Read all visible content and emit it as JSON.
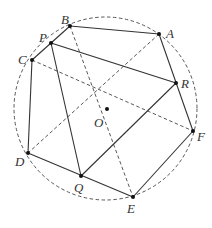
{
  "diagram": {
    "circle": {
      "cx": 105.5,
      "cy": 108.5,
      "r": 91.5,
      "style": "dashed"
    },
    "points": [
      {
        "id": "A",
        "label": "A",
        "x": 159,
        "y": 34,
        "lx": 166,
        "ly": 38
      },
      {
        "id": "B",
        "label": "B",
        "x": 70,
        "y": 26,
        "lx": 61,
        "ly": 24
      },
      {
        "id": "C",
        "label": "C",
        "x": 32,
        "y": 60,
        "lx": 18,
        "ly": 64
      },
      {
        "id": "D",
        "label": "D",
        "x": 28,
        "y": 153,
        "lx": 15,
        "ly": 166
      },
      {
        "id": "E",
        "label": "E",
        "x": 133,
        "y": 197,
        "lx": 127,
        "ly": 213
      },
      {
        "id": "F",
        "label": "F",
        "x": 193,
        "y": 131,
        "lx": 197,
        "ly": 141
      },
      {
        "id": "O",
        "label": "O",
        "x": 107,
        "y": 109,
        "lx": 94,
        "ly": 127
      },
      {
        "id": "P",
        "label": "P",
        "x": 51,
        "y": 43,
        "lx": 39,
        "ly": 42
      },
      {
        "id": "Q",
        "label": "Q",
        "x": 81,
        "y": 176,
        "lx": 74,
        "ly": 192
      },
      {
        "id": "R",
        "label": "R",
        "x": 176,
        "y": 83,
        "lx": 181,
        "ly": 88
      }
    ],
    "solid_segments": [
      [
        "B",
        "A"
      ],
      [
        "A",
        "F"
      ],
      [
        "B",
        "C"
      ],
      [
        "C",
        "D"
      ],
      [
        "D",
        "E"
      ],
      [
        "E",
        "F"
      ],
      [
        "P",
        "R"
      ],
      [
        "P",
        "Q"
      ],
      [
        "Q",
        "R"
      ]
    ],
    "dashed_segments": [
      [
        "B",
        "E"
      ],
      [
        "A",
        "D"
      ],
      [
        "C",
        "F"
      ]
    ]
  }
}
